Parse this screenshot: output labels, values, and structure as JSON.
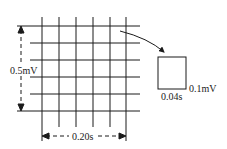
{
  "diagram": {
    "grid": {
      "horizontal_lines_y": [
        26,
        43,
        60,
        77,
        94,
        111
      ],
      "vertical_lines_x": [
        42,
        59,
        76,
        93,
        110,
        126
      ],
      "line_color": "#1a1a1a"
    },
    "labels": {
      "vertical_span": "0.5mV",
      "horizontal_span": "0.20s",
      "cell_width": "0.04s",
      "cell_height": "0.1mV"
    },
    "callout": {
      "description": "single small square enlarged",
      "arrow": "curved arrow pointing to enlarged cell"
    }
  }
}
